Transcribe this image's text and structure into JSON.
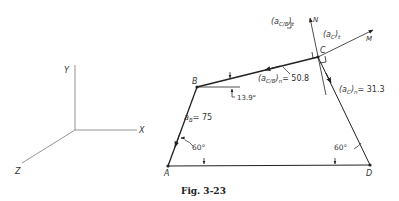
{
  "figure": {
    "caption": "Fig. 3-23"
  },
  "axes": {
    "x_label": "X",
    "y_label": "Y",
    "z_label": "Z"
  },
  "points": {
    "A": "A",
    "B": "B",
    "C": "C",
    "D": "D",
    "N": "N",
    "M": "M"
  },
  "annotations": {
    "aB_sym": "a",
    "aB_sub": "B",
    "aB_val": "= 75",
    "acb_n_sym": "(a",
    "acb_n_sub": "C/B",
    "acb_n_close": ")",
    "acb_n_subn": "n",
    "acb_n_val": "= 50.8",
    "acb_t_sym": "(a",
    "acb_t_sub": "C/B",
    "acb_t_close": ")",
    "acb_t_subt": "t",
    "ac_t_sym": "(a",
    "ac_t_sub": "C",
    "ac_t_close": ")",
    "ac_t_subt": "t",
    "ac_n_sym": "(a",
    "ac_n_sub": "C",
    "ac_n_close": ")",
    "ac_n_subn": "n",
    "ac_n_val": "= 31.3",
    "angle_B": "13.9°",
    "angle_A": "60°",
    "angle_D": "60°"
  }
}
